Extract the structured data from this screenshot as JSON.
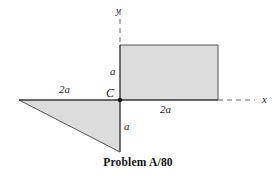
{
  "figure": {
    "caption": "Problem A/80",
    "background_color": "#ffffff",
    "shape_fill_color": "#dcdcdc",
    "shape_stroke_color": "#4a4a4a",
    "axis_color": "#2b2b2b",
    "dashed_axis_color": "#6b6b6b",
    "text_color": "#1a1a1a"
  },
  "axes": {
    "y_label": "y",
    "x_label": "x",
    "origin_label": "C",
    "origin_px": {
      "x": 120,
      "y": 100
    },
    "x_axis_solid_from_px": 19,
    "x_axis_solid_to_px": 218,
    "x_axis_dashed_to_px": 255,
    "y_axis_dashed_from_px": 10,
    "y_axis_dashed_to_px": 45
  },
  "dimensions": [
    {
      "name": "rect-height",
      "label": "a",
      "position": "left-of-rectangle-upper"
    },
    {
      "name": "triangle-height",
      "label": "a",
      "position": "below-origin-right"
    },
    {
      "name": "triangle-base",
      "label": "2a",
      "position": "left-of-origin-above-axis"
    },
    {
      "name": "rect-width",
      "label": "2a",
      "position": "right-of-origin-below-axis"
    }
  ],
  "shapes": {
    "rectangle": {
      "name": "rectangle",
      "points_px": "120,45 218,45 218,100 120,100",
      "width_label": "2a",
      "height_label": "a",
      "quadrant": "I"
    },
    "triangle": {
      "name": "triangle",
      "points_px": "19,100 120,100 120,152",
      "base_label": "2a",
      "height_label": "a",
      "quadrant": "III"
    }
  }
}
